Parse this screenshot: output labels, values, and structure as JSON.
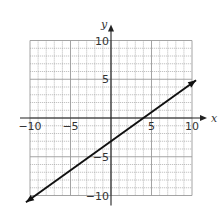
{
  "chart_data": {
    "type": "line",
    "title": "",
    "xlabel": "x",
    "ylabel": "y",
    "xlim": [
      -10,
      10
    ],
    "ylim": [
      -10,
      10
    ],
    "grid": true,
    "grid_step": 1,
    "x_ticks": [
      -10,
      -5,
      5,
      10
    ],
    "y_ticks": [
      10,
      5,
      -5,
      -10
    ],
    "x_tick_labels": [
      "−10",
      "−5",
      "5",
      "10"
    ],
    "y_tick_labels": [
      "10",
      "5",
      "−5",
      "−10"
    ],
    "series": [
      {
        "name": "line",
        "equation": "y = 0.75x - 3",
        "slope": 0.75,
        "intercept": -3,
        "x": [
          -10.5,
          10.5
        ],
        "y": [
          -10.875,
          4.875
        ],
        "arrows_both_ends": true,
        "points": [
          [
            -4,
            -6
          ],
          [
            0,
            -3
          ],
          [
            4,
            0
          ],
          [
            8,
            3
          ]
        ]
      }
    ],
    "legend": null
  },
  "colors": {
    "grid": "#9a9a9a",
    "axis": "#222222",
    "line": "#111111",
    "background": "#ffffff"
  }
}
